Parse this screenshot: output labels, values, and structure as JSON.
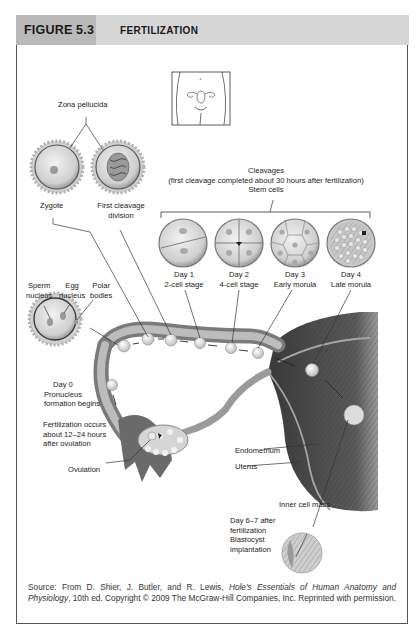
{
  "figure": {
    "number": "FIGURE 5.3",
    "title": "FERTILIZATION"
  },
  "labels": {
    "zona_pellucida": "Zona pellucida",
    "zygote": "Zygote",
    "first_cleavage_1": "First cleavage",
    "first_cleavage_2": "division",
    "cleavages_1": "Cleavages",
    "cleavages_2": "(first cleavage completed about 30 hours after fertilization)",
    "cleavages_3": "Stem cells",
    "stages": [
      {
        "day": "Day 1",
        "stage": "2-cell stage"
      },
      {
        "day": "Day 2",
        "stage": "4-cell stage"
      },
      {
        "day": "Day 3",
        "stage": "Early morula"
      },
      {
        "day": "Day 4",
        "stage": "Late morula"
      }
    ],
    "sperm_nucleus_1": "Sperm",
    "sperm_nucleus_2": "nucleus",
    "egg_nucleus_1": "Egg",
    "egg_nucleus_2": "nucleus",
    "polar_bodies_1": "Polar",
    "polar_bodies_2": "bodies",
    "day0_1": "Day 0",
    "day0_2": "Pronucleus",
    "day0_3": "formation begins",
    "fert_1": "Fertilization occurs",
    "fert_2": "about 12–24 hours",
    "fert_3": "after ovulation",
    "ovulation": "Ovulation",
    "endometrium": "Endometrium",
    "uterus": "Uterus",
    "inner_cell_mass": "Inner cell mass",
    "day67_1": "Day 6–7 after",
    "day67_2": "fertilization",
    "day67_3": "Blastocyst",
    "day67_4": "implantation"
  },
  "caption": {
    "prefix": "Source: From D. Shier, J. Butler, and R. Lewis, ",
    "book_title": "Hole's Essentials of Human Anatomy and Physiology",
    "suffix": ", 10th ed. Copyright © 2009 The McGraw-Hill Companies, Inc. Reprinted with permission."
  },
  "colors": {
    "header_dark": "#b9b9b9",
    "header_light": "#d6d6d6",
    "tissue_dark": "#4a4a4a",
    "tissue_mid": "#8a8a8a",
    "cell_fill": "#d9d9d9"
  }
}
